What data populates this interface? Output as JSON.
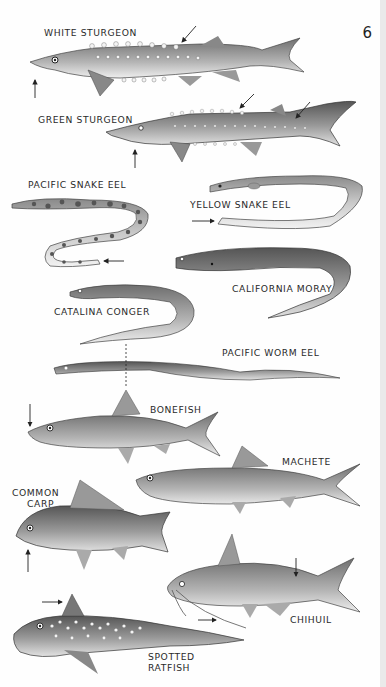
{
  "page": {
    "number": "6",
    "background": "#fefefe"
  },
  "species": [
    {
      "id": "white-sturgeon",
      "label": "WHITE STURGEON"
    },
    {
      "id": "green-sturgeon",
      "label": "GREEN STURGEON"
    },
    {
      "id": "pacific-snake-eel",
      "label": "PACIFIC SNAKE EEL"
    },
    {
      "id": "yellow-snake-eel",
      "label": "YELLOW SNAKE EEL"
    },
    {
      "id": "california-moray",
      "label": "CALIFORNIA MORAY"
    },
    {
      "id": "catalina-conger",
      "label": "CATALINA CONGER"
    },
    {
      "id": "pacific-worm-eel",
      "label": "PACIFIC WORM EEL"
    },
    {
      "id": "bonefish",
      "label": "BONEFISH"
    },
    {
      "id": "machete",
      "label": "MACHETE"
    },
    {
      "id": "common-carp",
      "label_line1": "COMMON",
      "label_line2": "CARP"
    },
    {
      "id": "chihuil",
      "label": "CHIHUIL"
    },
    {
      "id": "spotted-ratfish",
      "label_line1": "SPOTTED",
      "label_line2": "RATFISH"
    }
  ],
  "colors": {
    "ink": "#2a2a2a",
    "fish_dark": "#6b6b6b",
    "fish_mid": "#9a9a9a",
    "fish_light": "#d6d6d6"
  }
}
